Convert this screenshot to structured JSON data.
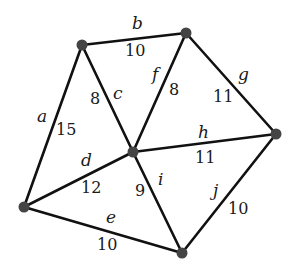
{
  "graph": {
    "type": "weighted-undirected",
    "vertices": [
      {
        "id": "top-left",
        "x": 82,
        "y": 45
      },
      {
        "id": "top-right",
        "x": 186,
        "y": 33
      },
      {
        "id": "center",
        "x": 133,
        "y": 152
      },
      {
        "id": "right",
        "x": 276,
        "y": 134
      },
      {
        "id": "left",
        "x": 24,
        "y": 207
      },
      {
        "id": "bottom",
        "x": 182,
        "y": 253
      }
    ],
    "edges": [
      {
        "name": "a",
        "weight": "15",
        "from": "left",
        "to": "top-left"
      },
      {
        "name": "b",
        "weight": "10",
        "from": "top-left",
        "to": "top-right"
      },
      {
        "name": "c",
        "weight": "8",
        "from": "top-left",
        "to": "center"
      },
      {
        "name": "d",
        "weight": "12",
        "from": "left",
        "to": "center"
      },
      {
        "name": "e",
        "weight": "10",
        "from": "left",
        "to": "bottom"
      },
      {
        "name": "f",
        "weight": "8",
        "from": "center",
        "to": "top-right"
      },
      {
        "name": "g",
        "weight": "11",
        "from": "top-right",
        "to": "right"
      },
      {
        "name": "h",
        "weight": "11",
        "from": "center",
        "to": "right"
      },
      {
        "name": "i",
        "weight": "9",
        "from": "center",
        "to": "bottom"
      },
      {
        "name": "j",
        "weight": "10",
        "from": "bottom",
        "to": "right"
      }
    ]
  },
  "colors": {
    "edge": "#111111",
    "node": "#444444",
    "text": "#1a1a1a"
  }
}
